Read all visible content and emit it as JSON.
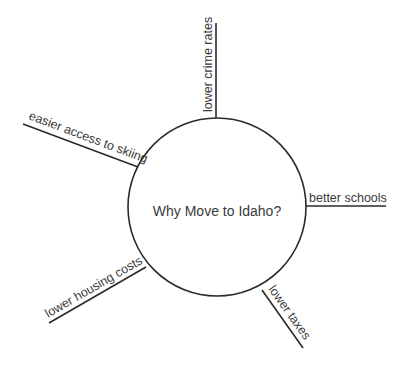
{
  "diagram": {
    "type": "spider-map",
    "center": {
      "label": "Why Move to Idaho?"
    },
    "branches": [
      {
        "label": "lower crime rates"
      },
      {
        "label": "better schools"
      },
      {
        "label": "lower taxes"
      },
      {
        "label": "lower housing costs"
      },
      {
        "label": "easier access to skiing"
      }
    ]
  }
}
